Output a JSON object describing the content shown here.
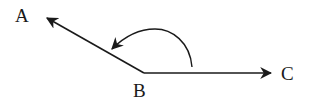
{
  "diagram": {
    "type": "angle",
    "points": {
      "A": {
        "label": "A",
        "x": 46,
        "y": 17
      },
      "B": {
        "label": "B",
        "x": 144,
        "y": 73
      },
      "C": {
        "label": "C",
        "x": 272,
        "y": 73
      }
    },
    "rays": [
      {
        "from": "B",
        "to": "A"
      },
      {
        "from": "B",
        "to": "C"
      }
    ],
    "rotation_arc": {
      "from": "BC",
      "to": "BA",
      "direction": "counterclockwise"
    },
    "colors": {
      "stroke": "#1a1a1a",
      "background": "#ffffff"
    }
  }
}
